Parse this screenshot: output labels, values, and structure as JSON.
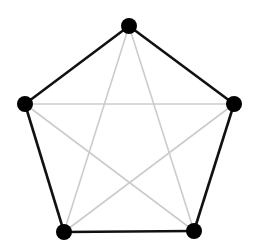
{
  "diagram": {
    "type": "complete-graph-K5",
    "colors": {
      "node": "#000000",
      "outer_edge": "#111111",
      "inner_edge": "#cccccc",
      "background": "#ffffff"
    },
    "nodes": [
      {
        "id": "top",
        "x": 129,
        "y": 26
      },
      {
        "id": "right",
        "x": 234,
        "y": 104
      },
      {
        "id": "bottom-right",
        "x": 194,
        "y": 231
      },
      {
        "id": "bottom-left",
        "x": 64,
        "y": 232
      },
      {
        "id": "left",
        "x": 25,
        "y": 104
      }
    ],
    "outer_edges": [
      [
        "top",
        "right"
      ],
      [
        "right",
        "bottom-right"
      ],
      [
        "bottom-right",
        "bottom-left"
      ],
      [
        "bottom-left",
        "left"
      ],
      [
        "left",
        "top"
      ]
    ],
    "inner_edges": [
      [
        "top",
        "bottom-right"
      ],
      [
        "top",
        "bottom-left"
      ],
      [
        "left",
        "right"
      ],
      [
        "left",
        "bottom-right"
      ],
      [
        "right",
        "bottom-left"
      ]
    ]
  }
}
